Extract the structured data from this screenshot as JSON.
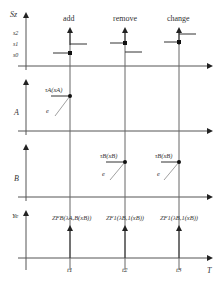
{
  "diagram": {
    "events": [
      {
        "label": "add",
        "time": "t1"
      },
      {
        "label": "remove",
        "time": "t2"
      },
      {
        "label": "change",
        "time": "t3"
      }
    ],
    "panels": [
      {
        "axis": "Sz",
        "ticks": [
          "s2",
          "s1",
          "s0"
        ]
      },
      {
        "axis": "A",
        "annotation": "τA(xA)",
        "edge": "e"
      },
      {
        "axis": "B",
        "annotations": [
          "τB(xB)",
          "τB(xB)"
        ],
        "edge": "e"
      },
      {
        "axis": "Ye",
        "annotations": [
          "ZFB(λA,B(xB))",
          "ZF1(λB,1(xB))",
          "ZF1(λB,1(xB))"
        ]
      }
    ],
    "time_axis": "T",
    "labels": {
      "event_add": "add",
      "event_remove": "remove",
      "event_change": "change",
      "axis_sz": "Sz",
      "tick_s2": "s2",
      "tick_s1": "s1",
      "tick_s0": "s0",
      "axis_a": "A",
      "axis_b": "B",
      "axis_ye": "Ye",
      "tau_a": "τA(xA)",
      "tau_b1": "τB(xB)",
      "tau_b2": "τB(xB)",
      "edge_a": "e",
      "edge_b1": "e",
      "edge_b2": "e",
      "z1": "ZFB(λA,B(xB))",
      "z2": "ZF1(λB,1(xB))",
      "z3": "ZF1(λB,1(xB))",
      "t1": "t1",
      "t2": "t2",
      "t3": "t3",
      "time_axis": "T"
    }
  }
}
